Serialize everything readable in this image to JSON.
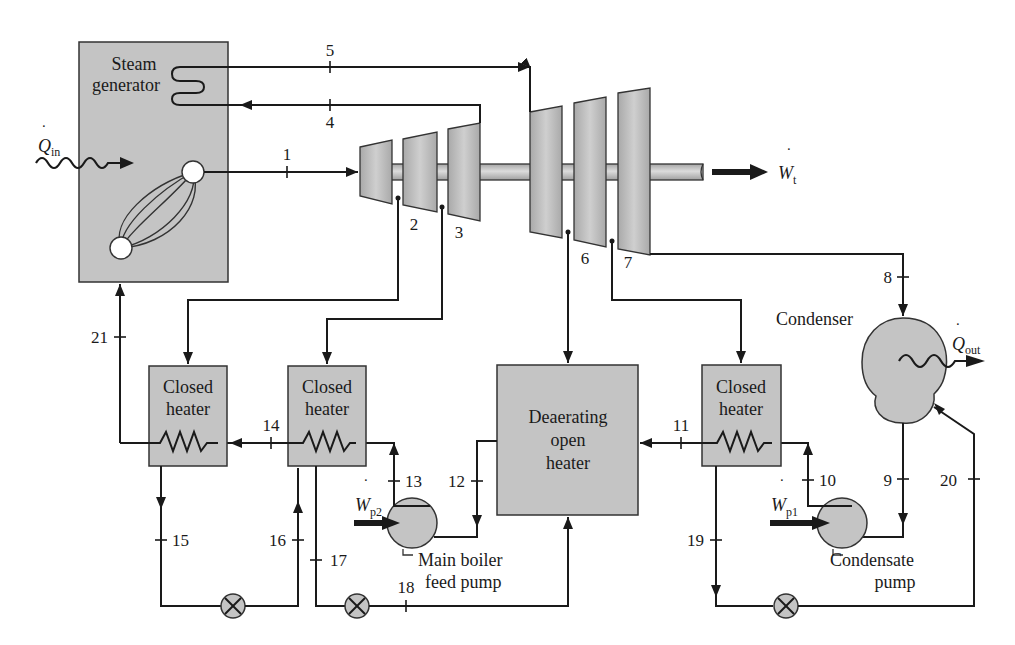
{
  "diagram": {
    "type": "regenerative-vapor-power-cycle-schematic",
    "components": {
      "steam_generator": {
        "label_line1": "Steam",
        "label_line2": "generator"
      },
      "closed_heater_a": {
        "label_line1": "Closed",
        "label_line2": "heater"
      },
      "closed_heater_b": {
        "label_line1": "Closed",
        "label_line2": "heater"
      },
      "closed_heater_c": {
        "label_line1": "Closed",
        "label_line2": "heater"
      },
      "deaerator": {
        "label_line1": "Deaerating",
        "label_line2": "open",
        "label_line3": "heater"
      },
      "condenser": {
        "label": "Condenser"
      },
      "condensate_pump": {
        "label_line1": "Condensate",
        "label_line2": "pump"
      },
      "main_feed_pump": {
        "label_line1": "Main boiler",
        "label_line2": "feed pump"
      }
    },
    "energy": {
      "q_in": {
        "symbol": "Q",
        "subscript": "in"
      },
      "q_out": {
        "symbol": "Q",
        "subscript": "out"
      },
      "w_t": {
        "symbol": "W",
        "subscript": "t"
      },
      "w_p1": {
        "symbol": "W",
        "subscript": "p1"
      },
      "w_p2": {
        "symbol": "W",
        "subscript": "p2"
      }
    },
    "states": {
      "s1": "1",
      "s2": "2",
      "s3": "3",
      "s4": "4",
      "s5": "5",
      "s6": "6",
      "s7": "7",
      "s8": "8",
      "s9": "9",
      "s10": "10",
      "s11": "11",
      "s12": "12",
      "s13": "13",
      "s14": "14",
      "s15": "15",
      "s16": "16",
      "s17": "17",
      "s18": "18",
      "s19": "19",
      "s20": "20",
      "s21": "21"
    },
    "colors": {
      "component_fill": "#c4c4c4",
      "line": "#1a1a1a",
      "background": "#ffffff"
    }
  }
}
